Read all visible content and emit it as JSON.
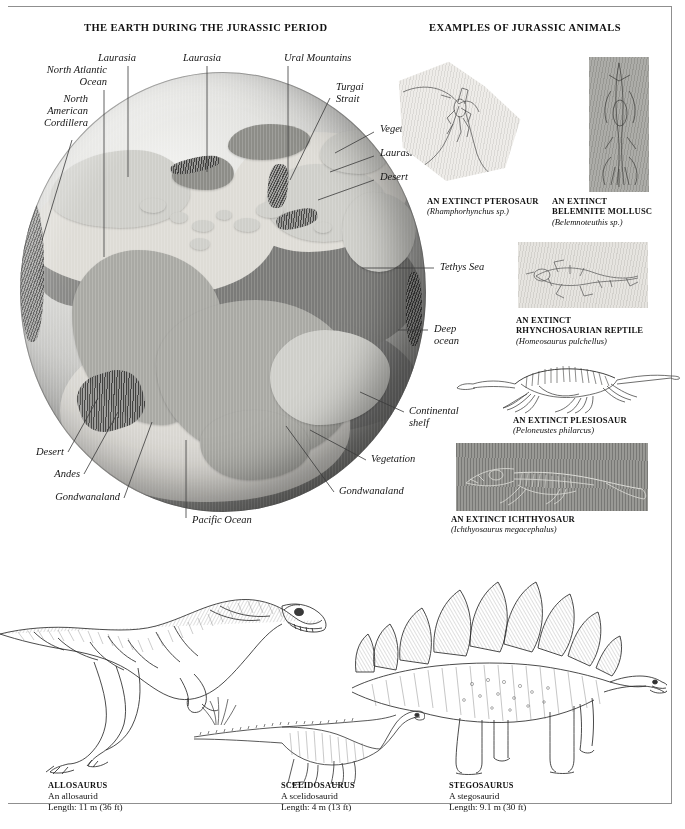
{
  "sections": {
    "left_title": "THE EARTH DURING THE JURASSIC PERIOD",
    "right_title": "EXAMPLES OF JURASSIC ANIMALS"
  },
  "globe": {
    "labels": [
      {
        "key": "laurasia_1",
        "text": "Laurasia"
      },
      {
        "key": "laurasia_2",
        "text": "Laurasia"
      },
      {
        "key": "north_atlantic_ocean",
        "text": "North Atlantic\nOcean"
      },
      {
        "key": "north_atlantic_ocean_l1",
        "text": "North Atlantic"
      },
      {
        "key": "north_atlantic_ocean_l2",
        "text": "Ocean"
      },
      {
        "key": "north_american_cordillera_l1",
        "text": "North"
      },
      {
        "key": "north_american_cordillera_l2",
        "text": "American"
      },
      {
        "key": "north_american_cordillera_l3",
        "text": "Cordillera"
      },
      {
        "key": "ural_mountains",
        "text": "Ural Mountains"
      },
      {
        "key": "turgai_strait_l1",
        "text": "Turgai"
      },
      {
        "key": "turgai_strait_l2",
        "text": "Strait"
      },
      {
        "key": "vegetation_ne",
        "text": "Vegetation"
      },
      {
        "key": "laurasia_3",
        "text": "Laurasia"
      },
      {
        "key": "desert_e",
        "text": "Desert"
      },
      {
        "key": "tethys_sea",
        "text": "Tethys Sea"
      },
      {
        "key": "deep_ocean_l1",
        "text": "Deep"
      },
      {
        "key": "deep_ocean_l2",
        "text": "ocean"
      },
      {
        "key": "continental_shelf_l1",
        "text": "Continental"
      },
      {
        "key": "continental_shelf_l2",
        "text": "shelf"
      },
      {
        "key": "vegetation_se",
        "text": "Vegetation"
      },
      {
        "key": "gondwanaland_se",
        "text": "Gondwanaland"
      },
      {
        "key": "pacific_ocean",
        "text": "Pacific Ocean"
      },
      {
        "key": "gondwanaland_sw",
        "text": "Gondwanaland"
      },
      {
        "key": "andes",
        "text": "Andes"
      },
      {
        "key": "desert_w",
        "text": "Desert"
      }
    ]
  },
  "specimens": [
    {
      "key": "pterosaur",
      "name": "AN EXTINCT PTEROSAUR",
      "species": "(Rhamphorhynchus sp.)",
      "image_name": "pterosaur-fossil-plate"
    },
    {
      "key": "belemnite",
      "name_line1": "AN EXTINCT",
      "name_line2": "BELEMNITE MOLLUSC",
      "species": "(Belemnoteuthis sp.)",
      "image_name": "belemnite-fossil-plate"
    },
    {
      "key": "rhynchosaur",
      "name_line1": "AN EXTINCT",
      "name_line2": "RHYNCHOSAURIAN REPTILE",
      "species": "(Homeosaurus pulchellus)",
      "image_name": "rhynchosaur-fossil-plate"
    },
    {
      "key": "plesiosaur",
      "name": "AN EXTINCT PLESIOSAUR",
      "species": "(Peloneustes philarcus)",
      "image_name": "plesiosaur-fossil-skeleton"
    },
    {
      "key": "ichthyosaur",
      "name": "AN EXTINCT ICHTHYOSAUR",
      "species": "(Ichthyosaurus megacephalus)",
      "image_name": "ichthyosaur-fossil-plate"
    }
  ],
  "dinosaurs": [
    {
      "key": "allosaurus",
      "name": "ALLOSAURUS",
      "group": "An allosaurid",
      "length": "Length: 11 m (36 ft)",
      "image_name": "allosaurus-illustration"
    },
    {
      "key": "scelidosaurus",
      "name": "SCELIDOSAURUS",
      "group": "A scelidosaurid",
      "length": "Length: 4 m (13 ft)",
      "image_name": "scelidosaurus-illustration"
    },
    {
      "key": "stegosaurus",
      "name": "STEGOSAURUS",
      "group": "A stegosaurid",
      "length": "Length: 9.1 m (30 ft)",
      "image_name": "stegosaurus-illustration"
    }
  ],
  "colors": {
    "ink": "#1a1a1a",
    "rule": "#8f8f8f",
    "ocean_light": "#cfcfca",
    "ocean_dark": "#6d6d6b",
    "land": "#a9a9a4",
    "plate_bg": "#dcdcd8"
  }
}
